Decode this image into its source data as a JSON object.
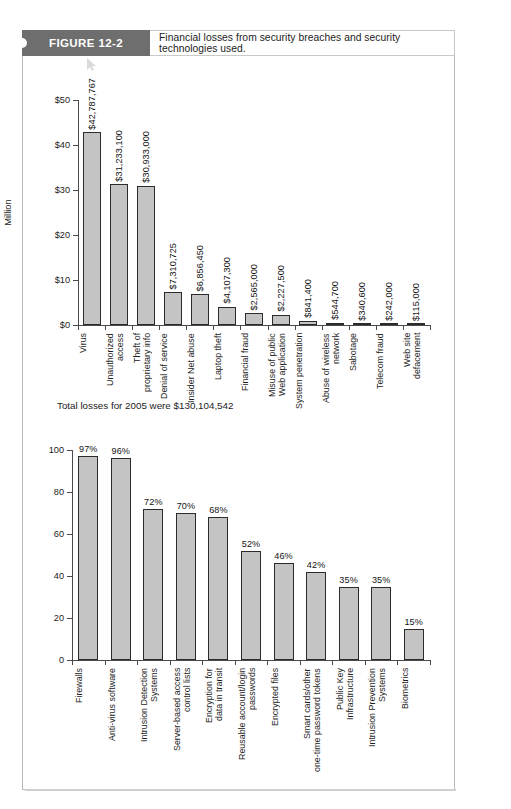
{
  "figure": {
    "tab_label": "FIGURE 12-2",
    "caption": "Financial losses from security breaches and security technologies used."
  },
  "total_note": "Total losses for 2005 were $130,104,542",
  "chart_data": [
    {
      "type": "bar",
      "title": "",
      "xlabel": "",
      "ylabel": "Million",
      "ylim": [
        0,
        50
      ],
      "yticks": [
        "$0",
        "$10",
        "$20",
        "$30",
        "$40",
        "$50"
      ],
      "ytick_values": [
        0,
        10,
        20,
        30,
        40,
        50
      ],
      "grid": false,
      "legend": "none",
      "categories": [
        "Virus",
        "Unauthorized\naccess",
        "Theft of\nproprietary info",
        "Denial of service",
        "Insider Net abuse",
        "Laptop theft",
        "Financial fraud",
        "Misuse of public\nWeb application",
        "System penetration",
        "Abuse of wireless\nnetwork",
        "Sabotage",
        "Telecom fraud",
        "Web site\ndefacement"
      ],
      "values": [
        42.787767,
        31.2331,
        30.933,
        7.310725,
        6.85645,
        4.1073,
        2.565,
        2.2275,
        0.8414,
        0.5447,
        0.3406,
        0.242,
        0.115
      ],
      "data_labels": [
        "$42,787,767",
        "$31,233,100",
        "$30,933,000",
        "$7,310,725",
        "$6,856,450",
        "$4,107,300",
        "$2,565,000",
        "$2,227,500",
        "$841,400",
        "$544,700",
        "$340,600",
        "$242,000",
        "$115,000"
      ]
    },
    {
      "type": "bar",
      "title": "",
      "xlabel": "",
      "ylabel": "",
      "ylim": [
        0,
        100
      ],
      "yticks": [
        "0",
        "20",
        "40",
        "60",
        "80",
        "100"
      ],
      "ytick_values": [
        0,
        20,
        40,
        60,
        80,
        100
      ],
      "grid": false,
      "legend": "none",
      "categories": [
        "Firewalls",
        "Anti-virus software",
        "Intrusion Detection\nSystems",
        "Server-based access\ncontrol lists",
        "Encryption for\ndata in transit",
        "Reusable account/login\npasswords",
        "Encrypted files",
        "Smart cards/other\none-time password tokens",
        "Public Key\nInfrastructure",
        "Intrusion Prevention\nSystems",
        "Biometrics"
      ],
      "values": [
        97,
        96,
        72,
        70,
        68,
        52,
        46,
        42,
        35,
        35,
        15
      ],
      "data_labels": [
        "97%",
        "96%",
        "72%",
        "70%",
        "68%",
        "52%",
        "46%",
        "42%",
        "35%",
        "35%",
        "15%"
      ]
    }
  ]
}
